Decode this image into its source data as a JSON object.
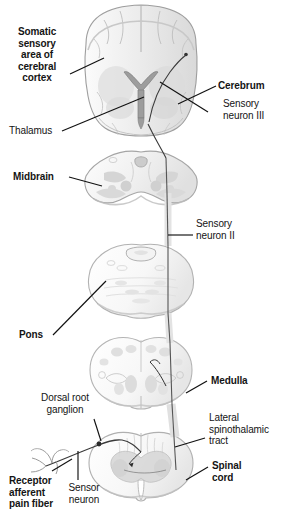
{
  "figure": {
    "background_color": "#ffffff",
    "line_color": "#111111",
    "tissue_fill": "#ebebeb",
    "tissue_stroke": "#9a9a9a",
    "gray_matter_fill": "#d2d2d2"
  },
  "labels": [
    {
      "id": "somatic-sensory-area",
      "text": "Somatic\nsensory\narea of\ncerebral\ncortex",
      "bold": true,
      "align": "center"
    },
    {
      "id": "cerebrum",
      "text": "Cerebrum",
      "bold": true,
      "align": "left"
    },
    {
      "id": "sensory-neuron-iii",
      "text": "Sensory\nneuron III",
      "bold": false,
      "align": "left"
    },
    {
      "id": "thalamus",
      "text": "Thalamus",
      "bold": false,
      "align": "left"
    },
    {
      "id": "midbrain",
      "text": "Midbrain",
      "bold": true,
      "align": "left"
    },
    {
      "id": "sensory-neuron-ii",
      "text": "Sensory\nneuron II",
      "bold": false,
      "align": "left"
    },
    {
      "id": "pons",
      "text": "Pons",
      "bold": true,
      "align": "left"
    },
    {
      "id": "medulla",
      "text": "Medulla",
      "bold": true,
      "align": "left"
    },
    {
      "id": "dorsal-root-ganglion",
      "text": "Dorsal root\nganglion",
      "bold": false,
      "align": "center"
    },
    {
      "id": "lateral-spinothalamic-tract",
      "text": "Lateral\nspinothalamic\ntract",
      "bold": false,
      "align": "left"
    },
    {
      "id": "spinal-cord",
      "text": "Spinal\ncord",
      "bold": true,
      "align": "left"
    },
    {
      "id": "receptor-afferent-pain-fiber",
      "text": "Receptor\nafferent\npain fiber",
      "bold": true,
      "align": "left"
    },
    {
      "id": "sensor-neuron",
      "text": "Sensor\nneuron",
      "bold": false,
      "align": "center"
    }
  ],
  "structures": [
    {
      "id": "cerebrum-section",
      "name": "cerebrum coronal section"
    },
    {
      "id": "midbrain-section",
      "name": "midbrain cross section"
    },
    {
      "id": "pons-section",
      "name": "pons cross section"
    },
    {
      "id": "medulla-section",
      "name": "medulla oblongata cross section"
    },
    {
      "id": "spinal-cord-section",
      "name": "spinal cord cross section"
    },
    {
      "id": "pain-fiber",
      "name": "peripheral receptor pain fiber"
    },
    {
      "id": "ascending-tract-line",
      "name": "ascending sensory tract"
    }
  ]
}
